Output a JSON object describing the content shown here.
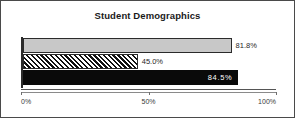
{
  "chart_data": {
    "type": "bar",
    "orientation": "horizontal",
    "title": "Student Demographics",
    "xlabel": "",
    "ylabel": "",
    "xlim": [
      0,
      100
    ],
    "grid": false,
    "legend": "none",
    "categories": [
      "Series 1",
      "Series 2",
      "Series 3"
    ],
    "values": [
      81.8,
      45.0,
      84.5
    ],
    "data_labels": [
      "81.8%",
      "45.0%",
      "84.5%"
    ],
    "label_positions": [
      "outside",
      "outside",
      "inside"
    ],
    "fills": [
      "light-gray",
      "diagonal-hatch",
      "solid-black"
    ],
    "xticks": [
      0,
      50,
      100
    ],
    "xtick_labels": [
      "0%",
      "50%",
      "100%"
    ]
  },
  "style": {
    "frame_border": "#4a4a4a",
    "background": "#ffffff",
    "bar_gray": "#c8c8c8",
    "bar_black": "#0a0a0a",
    "bar_outline": "#2b2b2b",
    "axis_color": "#555555",
    "title_color": "#1a1a1a",
    "tick_label_color": "#3a3a3a",
    "inside_label_color": "#ffffff"
  }
}
